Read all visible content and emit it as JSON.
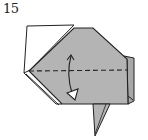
{
  "step": {
    "number": "15"
  },
  "diagram": {
    "elements": [
      {
        "name": "white-back-flap",
        "fill": "#ffffff"
      },
      {
        "name": "gray-main-body",
        "fill": "#b4b4b4"
      },
      {
        "name": "right-side-flap",
        "fill": "#a8a8a8"
      },
      {
        "name": "bottom-point",
        "fill": "#b4b4b4"
      },
      {
        "name": "valley-fold-line",
        "style": "dashed"
      },
      {
        "name": "fold-and-unfold-arrow",
        "direction": "down"
      }
    ],
    "colors": {
      "paper_colored": "#b4b4b4",
      "paper_white": "#ffffff",
      "stroke": "#222222"
    }
  }
}
